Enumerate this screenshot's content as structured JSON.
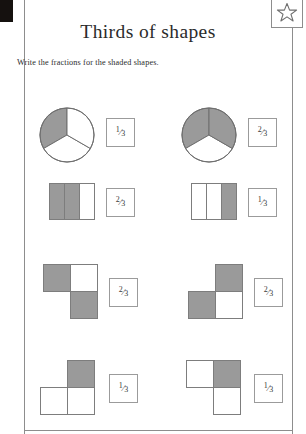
{
  "worksheet": {
    "title": "Thirds of shapes",
    "instruction": "Write the fractions for the shaded shapes.",
    "star_icon": "star-icon",
    "colors": {
      "shaded": "#9a9a9a",
      "blank": "#ffffff",
      "outline": "#7d7d7d",
      "border": "#8d8d8d",
      "text": "#2b2b2b"
    }
  },
  "problems": [
    {
      "id": "p1",
      "shape_type": "circle-thirds",
      "shaded_parts": 1,
      "total_parts": 3,
      "answer": "1/3",
      "answer_numerator": "1",
      "answer_denominator": "3"
    },
    {
      "id": "p2",
      "shape_type": "circle-thirds",
      "shaded_parts": 2,
      "total_parts": 3,
      "answer": "2/3",
      "answer_numerator": "2",
      "answer_denominator": "3"
    },
    {
      "id": "p3",
      "shape_type": "rectangle-vertical-thirds",
      "shaded_parts": 2,
      "total_parts": 3,
      "answer": "2/3",
      "answer_numerator": "2",
      "answer_denominator": "3"
    },
    {
      "id": "p4",
      "shape_type": "rectangle-vertical-thirds",
      "shaded_parts": 1,
      "total_parts": 3,
      "answer": "1/3",
      "answer_numerator": "1",
      "answer_denominator": "3"
    },
    {
      "id": "p5",
      "shape_type": "s-shape-three-squares",
      "shaded_parts": 2,
      "total_parts": 3,
      "answer": "2/3",
      "answer_numerator": "2",
      "answer_denominator": "3"
    },
    {
      "id": "p6",
      "shape_type": "s-shape-three-squares",
      "shaded_parts": 2,
      "total_parts": 3,
      "answer": "2/3",
      "answer_numerator": "2",
      "answer_denominator": "3"
    },
    {
      "id": "p7",
      "shape_type": "t-shape-three-squares",
      "shaded_parts": 1,
      "total_parts": 3,
      "answer": "1/3",
      "answer_numerator": "1",
      "answer_denominator": "3"
    },
    {
      "id": "p8",
      "shape_type": "s-shape-three-squares",
      "shaded_parts": 1,
      "total_parts": 3,
      "answer": "1/3",
      "answer_numerator": "1",
      "answer_denominator": "3"
    }
  ]
}
